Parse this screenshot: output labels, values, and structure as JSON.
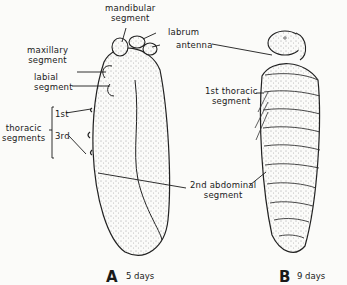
{
  "figure": {
    "panel_a": {
      "letter": "A",
      "age": "5 days",
      "labels": {
        "mandibular_1": "mandibular",
        "mandibular_2": "segment",
        "labrum": "labrum",
        "antenna": "antenna",
        "maxillary_1": "maxillary",
        "maxillary_2": "segment",
        "labial_1": "labial",
        "labial_2": "segment",
        "thoracic_1": "thoracic",
        "thoracic_2": "segments",
        "first": "1st",
        "third": "3rd"
      }
    },
    "panel_b": {
      "letter": "B",
      "age": "9 days",
      "labels": {
        "first_thoracic_1": "1st thoracic",
        "first_thoracic_2": "segment"
      }
    },
    "shared": {
      "abdominal_1": "2nd abdominal",
      "abdominal_2": "segment"
    }
  }
}
